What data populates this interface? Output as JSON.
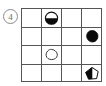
{
  "figure": {
    "kind": "matrix-reasoning-item",
    "item_label": "4",
    "background_color": "#ffffff",
    "line_color": "#555555",
    "fill_color": "#0a0a0a",
    "label_color": "#6f6f6f"
  },
  "grid": {
    "rows": 4,
    "cols": 4,
    "bounds": {
      "x": 21,
      "y": 8,
      "width": 81,
      "height": 74
    },
    "col_edges": [
      0,
      20,
      40,
      60,
      81
    ],
    "row_edges": [
      0,
      19,
      37,
      56,
      74
    ],
    "cells": [
      {
        "row": 1,
        "col": 1,
        "shape": "empty",
        "fill": "none"
      },
      {
        "row": 1,
        "col": 2,
        "shape": "circle",
        "fill": "half-bottom"
      },
      {
        "row": 1,
        "col": 3,
        "shape": "empty",
        "fill": "none"
      },
      {
        "row": 1,
        "col": 4,
        "shape": "empty",
        "fill": "none"
      },
      {
        "row": 2,
        "col": 1,
        "shape": "empty",
        "fill": "none"
      },
      {
        "row": 2,
        "col": 2,
        "shape": "empty",
        "fill": "none"
      },
      {
        "row": 2,
        "col": 3,
        "shape": "empty",
        "fill": "none"
      },
      {
        "row": 2,
        "col": 4,
        "shape": "blob",
        "fill": "solid"
      },
      {
        "row": 3,
        "col": 1,
        "shape": "empty",
        "fill": "none"
      },
      {
        "row": 3,
        "col": 2,
        "shape": "blob",
        "fill": "none"
      },
      {
        "row": 3,
        "col": 3,
        "shape": "empty",
        "fill": "none"
      },
      {
        "row": 3,
        "col": 4,
        "shape": "empty",
        "fill": "none"
      },
      {
        "row": 4,
        "col": 1,
        "shape": "empty",
        "fill": "none"
      },
      {
        "row": 4,
        "col": 2,
        "shape": "empty",
        "fill": "none"
      },
      {
        "row": 4,
        "col": 3,
        "shape": "empty",
        "fill": "none"
      },
      {
        "row": 4,
        "col": 4,
        "shape": "pentagon",
        "fill": "half-left"
      }
    ]
  }
}
